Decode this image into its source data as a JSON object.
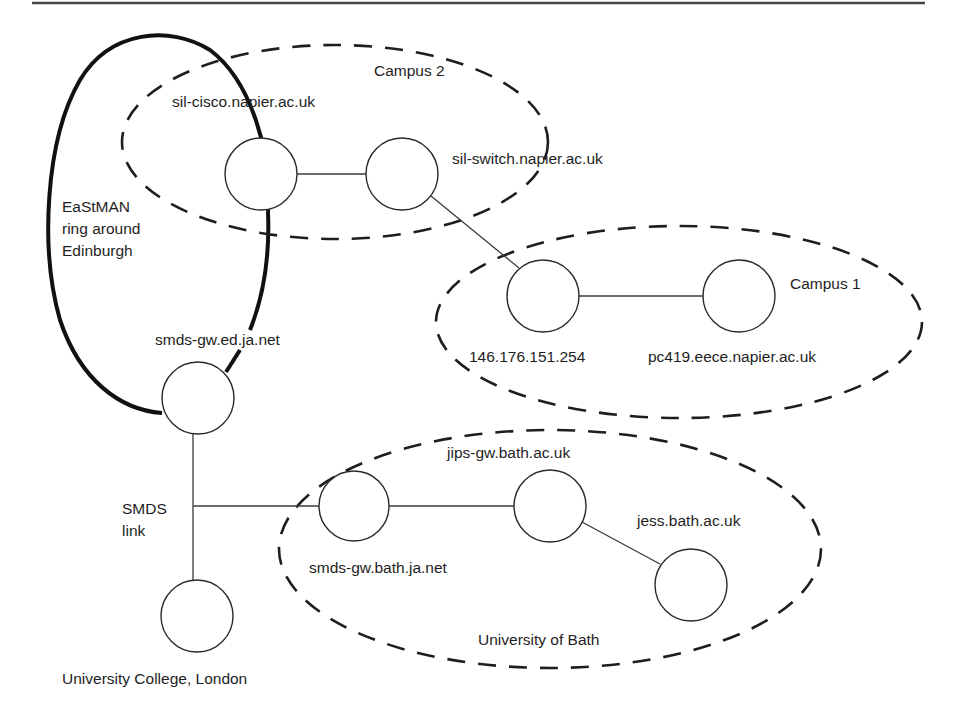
{
  "diagram": {
    "colors": {
      "line": "#3a3a3a",
      "ring": "#111111",
      "text": "#1e1e1e",
      "background": "#ffffff"
    },
    "zones": [
      {
        "id": "campus2",
        "label": "Campus 2"
      },
      {
        "id": "campus1",
        "label": "Campus 1"
      },
      {
        "id": "bath",
        "label": "University of Bath"
      }
    ],
    "ring": {
      "label_lines": [
        "EaStMAN",
        "ring around",
        "Edinburgh"
      ]
    },
    "nodes": [
      {
        "id": "sil-cisco",
        "label": "sil-cisco.napier.ac.uk"
      },
      {
        "id": "sil-switch",
        "label": "sil-switch.napier.ac.uk"
      },
      {
        "id": "router-146",
        "label": "146.176.151.254"
      },
      {
        "id": "pc419",
        "label": "pc419.eece.napier.ac.uk"
      },
      {
        "id": "smds-gw-ed",
        "label": "smds-gw.ed.ja.net"
      },
      {
        "id": "smds-gw-bath",
        "label": "smds-gw.bath.ja.net"
      },
      {
        "id": "jips-gw",
        "label": "jips-gw.bath.ac.uk"
      },
      {
        "id": "jess",
        "label": "jess.bath.ac.uk"
      },
      {
        "id": "ucl",
        "label": "University College, London"
      }
    ],
    "link_labels": {
      "smds": [
        "SMDS",
        "link"
      ]
    },
    "edges": [
      [
        "sil-cisco",
        "sil-switch"
      ],
      [
        "sil-switch",
        "router-146"
      ],
      [
        "router-146",
        "pc419"
      ],
      [
        "smds-gw-ed",
        "ucl"
      ],
      [
        "smds-junction",
        "smds-gw-bath"
      ],
      [
        "smds-gw-bath",
        "jips-gw"
      ],
      [
        "jips-gw",
        "jess"
      ]
    ]
  }
}
